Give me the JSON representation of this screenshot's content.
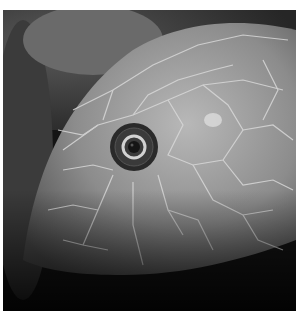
{
  "image": {
    "subject": "snake-head-closeup",
    "tone": "grayscale",
    "colors": {
      "background_dark": "#111111",
      "foliage": "#3a3a3a",
      "scale_mid": "#8a8a8a",
      "scale_light": "#b5b5b5",
      "scale_edge": "#d6d6d6",
      "eye_dark": "#1e1e1e",
      "eye_ring": "#cfcfcf"
    }
  }
}
